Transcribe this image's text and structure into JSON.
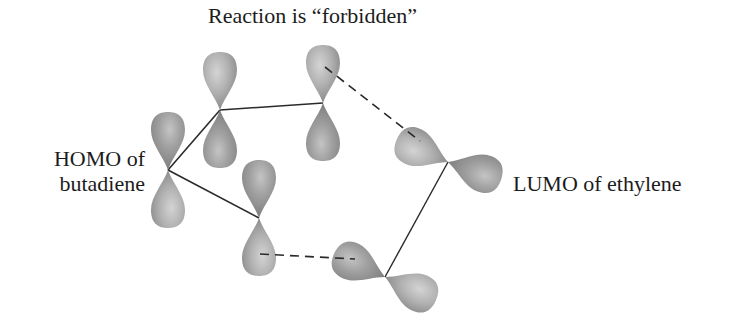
{
  "title": "Reaction is “forbidden”",
  "labels": {
    "homo_line1": "HOMO of",
    "homo_line2": "butadiene",
    "lumo": "LUMO of ethylene"
  },
  "colors": {
    "lobe_fill": "#a3a3a3",
    "lobe_highlight": "#d2d2d2",
    "lobe_shadow": "#7e7e7e",
    "bond": "#2a2a2a",
    "text": "#1c1c1c"
  },
  "molecules": [
    {
      "name": "butadiene",
      "orbital": "HOMO",
      "p_orbitals": [
        {
          "id": "C1",
          "node": [
            168,
            170
          ]
        },
        {
          "id": "C2",
          "node": [
            220,
            110
          ]
        },
        {
          "id": "C3",
          "node": [
            323,
            103
          ]
        },
        {
          "id": "C4",
          "node": [
            259,
            218
          ]
        }
      ]
    },
    {
      "name": "ethylene",
      "orbital": "LUMO",
      "p_orbitals": [
        {
          "id": "C5",
          "node": [
            448,
            162
          ]
        },
        {
          "id": "C6",
          "node": [
            385,
            277
          ]
        }
      ]
    }
  ],
  "interactions": [
    {
      "from": "C3",
      "to": "C5",
      "type": "dashed",
      "meaning": "antibonding/mismatched overlap"
    },
    {
      "from": "C4",
      "to": "C6",
      "type": "dashed",
      "meaning": "bonding overlap"
    }
  ]
}
